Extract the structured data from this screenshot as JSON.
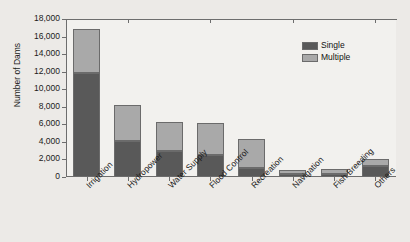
{
  "chart_data": {
    "type": "bar",
    "subtype": "stacked-vertical",
    "title": "",
    "xlabel": "",
    "ylabel": "Number of Dams",
    "ylim": [
      0,
      18000
    ],
    "ytick_values": [
      0,
      2000,
      4000,
      6000,
      8000,
      10000,
      12000,
      14000,
      16000,
      18000
    ],
    "ytick_labels": [
      "0",
      "2,000",
      "4,000",
      "6,000",
      "8,000",
      "10,000",
      "12,000",
      "14,000",
      "16,000",
      "18,000"
    ],
    "grid": false,
    "legend_position": "upper-right",
    "categories": [
      "Irrigation",
      "Hydropower",
      "Water Supply",
      "Flood Control",
      "Recreation",
      "Navigation",
      "Fish Breeding",
      "Others"
    ],
    "series": [
      {
        "name": "Single",
        "color": "#595959",
        "values": [
          11900,
          4100,
          3000,
          2500,
          1000,
          300,
          300,
          1200
        ]
      },
      {
        "name": "Multiple",
        "color": "#a9a9a9",
        "values": [
          4950,
          4100,
          3250,
          3650,
          3300,
          450,
          650,
          850
        ]
      }
    ],
    "totals": [
      16850,
      8200,
      6250,
      6150,
      4300,
      750,
      950,
      2050
    ]
  },
  "legend": {
    "items": [
      {
        "label": "Single",
        "color": "#595959"
      },
      {
        "label": "Multiple",
        "color": "#a9a9a9"
      }
    ]
  },
  "axes": {
    "y_title": "Number of Dams"
  }
}
